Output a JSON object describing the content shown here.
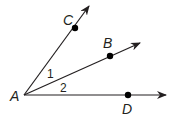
{
  "diagram": {
    "title": "",
    "vertex": {
      "label": "A"
    },
    "rays": [
      {
        "point_label": "C"
      },
      {
        "point_label": "B"
      },
      {
        "point_label": "D"
      }
    ],
    "angles": [
      {
        "label": "1",
        "between": [
          "C",
          "B"
        ]
      },
      {
        "label": "2",
        "between": [
          "B",
          "D"
        ]
      }
    ],
    "colors": {
      "stroke": "#231f20",
      "background": "#ffffff"
    }
  }
}
